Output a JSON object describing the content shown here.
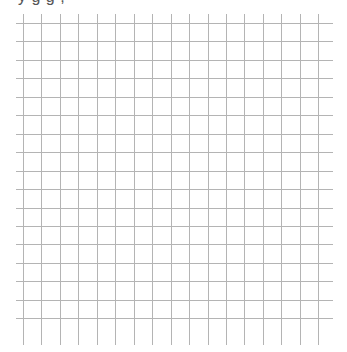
{
  "page": {
    "background": "#ffffff",
    "clipped_header_text": "y        g g                          ,"
  },
  "grid": {
    "line_color": "#b4b4b4",
    "line_width": 1,
    "count_vertical": 17,
    "count_horizontal": 17,
    "first_vertical_x": 23,
    "first_horizontal_y": 23,
    "spacing": 18.45,
    "h_line_start_x": 16,
    "h_line_end_x": 333,
    "v_line_start_y": 14,
    "v_line_end_y": 345
  }
}
